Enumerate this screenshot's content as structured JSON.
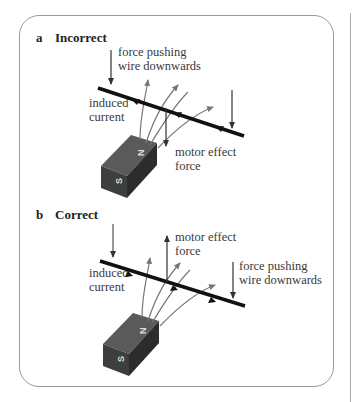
{
  "panels": [
    {
      "letter": "a",
      "title": "Incorrect",
      "labels": {
        "force_top_1": "force pushing",
        "force_top_2": "wire downwards",
        "induced_1": "induced",
        "induced_2": "current",
        "motor_1": "motor effect",
        "motor_2": "force"
      },
      "magnet": {
        "north": "N",
        "south": "S"
      }
    },
    {
      "letter": "b",
      "title": "Correct",
      "labels": {
        "motor_1": "motor effect",
        "motor_2": "force",
        "induced_1": "induced",
        "induced_2": "current",
        "force_right_1": "force pushing",
        "force_right_2": "wire downwards"
      },
      "magnet": {
        "north": "N",
        "south": "S"
      }
    }
  ],
  "colors": {
    "wire": "#111111",
    "field": "#777777",
    "magnet_top": "#5a5a5a",
    "magnet_front": "#3e3e3e",
    "magnet_side": "#2c2c2c",
    "frame": "#999999"
  }
}
